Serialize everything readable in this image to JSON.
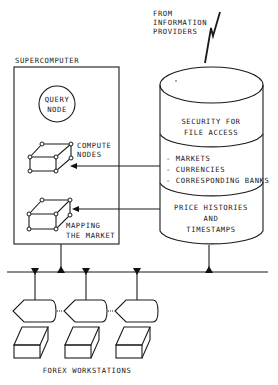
{
  "diagram": {
    "type": "system-architecture",
    "source_label": [
      "FROM",
      "INFORMATION",
      "PROVIDERS"
    ],
    "supercomputer": {
      "label": "SUPERCOMPUTER",
      "query_node": [
        "QUERY",
        "NODE"
      ],
      "compute_nodes": [
        "COMPUTE",
        "NODES"
      ],
      "mapping": [
        "MAPPING",
        "THE MARKET"
      ]
    },
    "database": {
      "security": [
        "SECURITY FOR",
        "FILE ACCESS"
      ],
      "reference_items": [
        "- MARKETS",
        "- CURRENCIES",
        "- CORRESPONDING BANKS"
      ],
      "history": [
        "PRICE HISTORIES",
        "AND",
        "TIMESTAMPS"
      ]
    },
    "workstations": {
      "label": "FOREX WORKSTATIONS",
      "count": 3
    },
    "colors": {
      "ink": "#1a1a1a",
      "paper": "#ffffff"
    }
  }
}
